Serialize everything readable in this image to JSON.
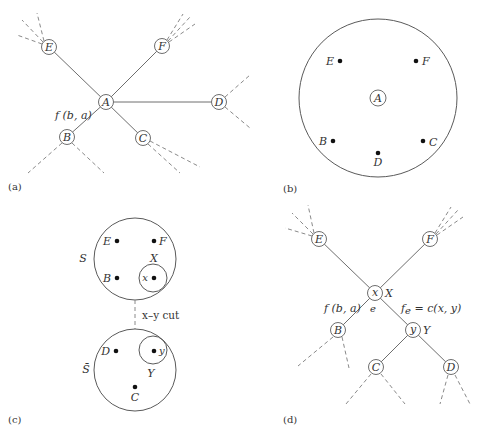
{
  "panels": {
    "a": {
      "caption": "(a)",
      "nodes": {
        "E": "E",
        "F": "F",
        "A": "A",
        "D": "D",
        "B": "B",
        "C": "C"
      },
      "edge_label": "f (b, a)"
    },
    "b": {
      "caption": "(b)",
      "center": "A",
      "points": {
        "E": "E",
        "F": "F",
        "B": "B",
        "C": "C",
        "D": "D"
      }
    },
    "c": {
      "caption": "(c)",
      "set_s": "S",
      "set_s_bar": "S̄",
      "top_points": {
        "E": "E",
        "F": "F",
        "B": "B",
        "x": "x"
      },
      "top_subset": "X",
      "bottom_points": {
        "D": "D",
        "y": "y",
        "C": "C"
      },
      "bottom_subset": "Y",
      "cut_label": "x–y cut"
    },
    "d": {
      "caption": "(d)",
      "nodes": {
        "E": "E",
        "F": "F",
        "x": "x",
        "B": "B",
        "y": "y",
        "C": "C",
        "D": "D"
      },
      "x_set": "X",
      "y_set": "Y",
      "edge_e": "e",
      "left_edge_label": "f (b, a)",
      "right_edge_label": "f",
      "right_edge_sub": "e",
      "right_edge_rest": " = c(x, y)"
    }
  }
}
